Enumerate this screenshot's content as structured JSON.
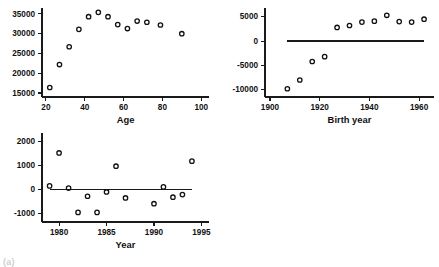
{
  "figure": {
    "caption": "(a)",
    "background": "#ffffff",
    "marker_color": "#111111",
    "axis_color": "#1a1a1a"
  },
  "chart_data": [
    {
      "type": "scatter",
      "title": "",
      "xlabel": "Age",
      "ylabel": "",
      "xlim": [
        18,
        104
      ],
      "ylim": [
        14000,
        36500
      ],
      "xticks": [
        20,
        40,
        60,
        80,
        100
      ],
      "yticks": [
        15000,
        20000,
        25000,
        30000,
        35000
      ],
      "grid": false,
      "legend": "none",
      "refline": null,
      "points": [
        {
          "x": 22,
          "y": 16400
        },
        {
          "x": 27,
          "y": 22200
        },
        {
          "x": 32,
          "y": 26700
        },
        {
          "x": 37,
          "y": 31100
        },
        {
          "x": 42,
          "y": 34300
        },
        {
          "x": 47,
          "y": 35400
        },
        {
          "x": 52,
          "y": 34300
        },
        {
          "x": 57,
          "y": 32300
        },
        {
          "x": 62,
          "y": 31300
        },
        {
          "x": 67,
          "y": 33200
        },
        {
          "x": 72,
          "y": 32900
        },
        {
          "x": 79,
          "y": 32200
        },
        {
          "x": 90,
          "y": 30000
        }
      ]
    },
    {
      "type": "scatter",
      "title": "",
      "xlabel": "Birth year",
      "ylabel": "",
      "xlim": [
        1898,
        1966
      ],
      "ylim": [
        -11500,
        6800
      ],
      "xticks": [
        1900,
        1920,
        1940,
        1960
      ],
      "yticks": [
        -10000,
        -5000,
        0,
        5000
      ],
      "grid": false,
      "legend": "none",
      "refline": {
        "y": 0,
        "x_start": 1907,
        "x_end": 1962
      },
      "points": [
        {
          "x": 1907,
          "y": -9800
        },
        {
          "x": 1912,
          "y": -8000
        },
        {
          "x": 1917,
          "y": -4200
        },
        {
          "x": 1922,
          "y": -3200
        },
        {
          "x": 1927,
          "y": 2800
        },
        {
          "x": 1932,
          "y": 3200
        },
        {
          "x": 1937,
          "y": 3900
        },
        {
          "x": 1942,
          "y": 4100
        },
        {
          "x": 1947,
          "y": 5300
        },
        {
          "x": 1952,
          "y": 4000
        },
        {
          "x": 1957,
          "y": 3900
        },
        {
          "x": 1962,
          "y": 4500
        }
      ]
    },
    {
      "type": "scatter",
      "title": "",
      "xlabel": "Year",
      "ylabel": "",
      "xlim": [
        1978.2,
        1995.8
      ],
      "ylim": [
        -1350,
        2350
      ],
      "xticks": [
        1980,
        1985,
        1990,
        1995
      ],
      "yticks": [
        -1000,
        0,
        1000,
        2000
      ],
      "grid": false,
      "legend": "none",
      "refline": {
        "y": 0,
        "x_start": 1979,
        "x_end": 1994
      },
      "points": [
        {
          "x": 1979,
          "y": 150
        },
        {
          "x": 1980,
          "y": 1520
        },
        {
          "x": 1981,
          "y": 60
        },
        {
          "x": 1982,
          "y": -950
        },
        {
          "x": 1983,
          "y": -280
        },
        {
          "x": 1984,
          "y": -950
        },
        {
          "x": 1985,
          "y": -100
        },
        {
          "x": 1986,
          "y": 970
        },
        {
          "x": 1987,
          "y": -350
        },
        {
          "x": 1990,
          "y": -590
        },
        {
          "x": 1991,
          "y": 110
        },
        {
          "x": 1992,
          "y": -320
        },
        {
          "x": 1993,
          "y": -210
        },
        {
          "x": 1994,
          "y": 1180
        }
      ]
    }
  ]
}
